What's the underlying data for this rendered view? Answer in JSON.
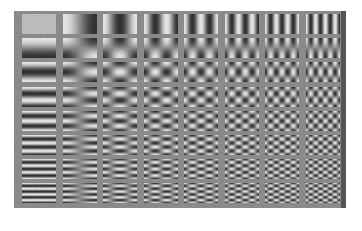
{
  "figure": {
    "rows": 8,
    "cols": 8,
    "background_gray": "#8a8a8a",
    "edge_color": "#555555",
    "cells": {
      "col0_x": 8,
      "col_pitch": 40.5,
      "cell_w": 34,
      "row0_y": 3,
      "row_pitch": 24.2,
      "cell_h": 20
    },
    "contrast": 0.75
  }
}
